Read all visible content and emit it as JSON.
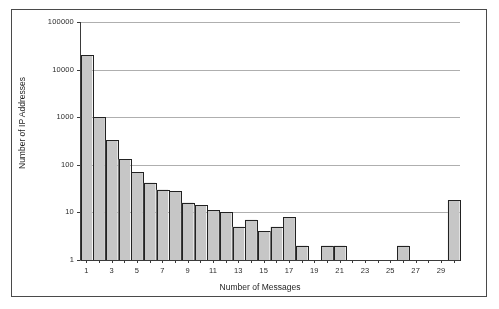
{
  "figure": {
    "border_color": "#4a4a4a",
    "background": "#ffffff"
  },
  "chart_data": {
    "type": "bar",
    "title": "",
    "xlabel": "Number of Messages",
    "ylabel": "Number of IP Addresses",
    "yscale": "log",
    "ylim": [
      1,
      100000
    ],
    "xlim": [
      0.5,
      30.5
    ],
    "grid": "horizontal",
    "legend": "none",
    "bar_color": "#c6c6c6",
    "bar_edge_color": "#222222",
    "categories": [
      1,
      2,
      3,
      4,
      5,
      6,
      7,
      8,
      9,
      10,
      11,
      12,
      13,
      14,
      15,
      16,
      17,
      18,
      19,
      20,
      21,
      22,
      23,
      24,
      25,
      26,
      27,
      28,
      29,
      30
    ],
    "values": [
      20000,
      1000,
      330,
      130,
      70,
      42,
      30,
      28,
      16,
      14,
      11,
      10,
      5,
      7,
      4,
      5,
      8,
      2,
      0,
      2,
      2,
      0,
      0,
      0,
      0,
      2,
      0,
      0,
      0,
      18
    ],
    "ytick_labels": [
      "1",
      "10",
      "100",
      "1000",
      "10000",
      "100000"
    ],
    "ytick_values": [
      1,
      10,
      100,
      1000,
      10000,
      100000
    ],
    "xtick_labels": [
      "1",
      "3",
      "5",
      "7",
      "9",
      "11",
      "13",
      "15",
      "17",
      "19",
      "21",
      "23",
      "25",
      "27",
      "29"
    ],
    "xtick_values": [
      1,
      3,
      5,
      7,
      9,
      11,
      13,
      15,
      17,
      19,
      21,
      23,
      25,
      27,
      29
    ]
  }
}
